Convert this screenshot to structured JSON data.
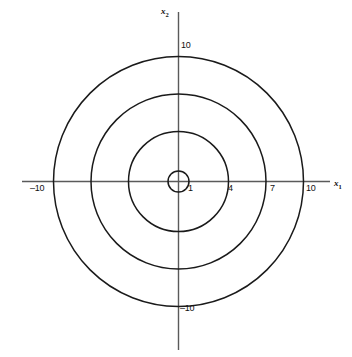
{
  "chart_data": {
    "type": "line",
    "title": "",
    "subtitle": "",
    "xlabel": "x₁",
    "ylabel": "x₂",
    "xlim": [
      -12.5,
      14
    ],
    "ylim": [
      -13.6,
      13.6
    ],
    "grid": false,
    "legend": null,
    "series": [
      {
        "name": "circle-r1",
        "shape": "circle",
        "center": [
          0,
          0
        ],
        "radius": 1
      },
      {
        "name": "circle-r4",
        "shape": "circle",
        "center": [
          0,
          0
        ],
        "radius": 4
      },
      {
        "name": "circle-r7",
        "shape": "circle",
        "center": [
          0,
          0
        ],
        "radius": 7
      },
      {
        "name": "circle-r10",
        "shape": "circle",
        "center": [
          0,
          0
        ],
        "radius": 10
      }
    ],
    "x_ticks": [
      {
        "value": -10,
        "label": "–10"
      },
      {
        "value": 1,
        "label": "1"
      },
      {
        "value": 4,
        "label": "4"
      },
      {
        "value": 7,
        "label": "7"
      },
      {
        "value": 10,
        "label": "10"
      }
    ],
    "y_ticks": [
      {
        "value": 10,
        "label": "10"
      },
      {
        "value": -10,
        "label": "–10"
      }
    ],
    "colors": {
      "background": "#ffffff",
      "axis": "#4d4d4d",
      "curve": "#1a1a1a",
      "text": "#111111"
    }
  },
  "figure": {
    "x_axis_label": "x",
    "x_axis_sub": "1",
    "y_axis_label": "x",
    "y_axis_sub": "2",
    "ticks": {
      "x_neg10": "–10",
      "x_1": "1",
      "x_4": "4",
      "x_7": "7",
      "x_10": "10",
      "y_pos10": "10",
      "y_neg10": "–10"
    }
  }
}
